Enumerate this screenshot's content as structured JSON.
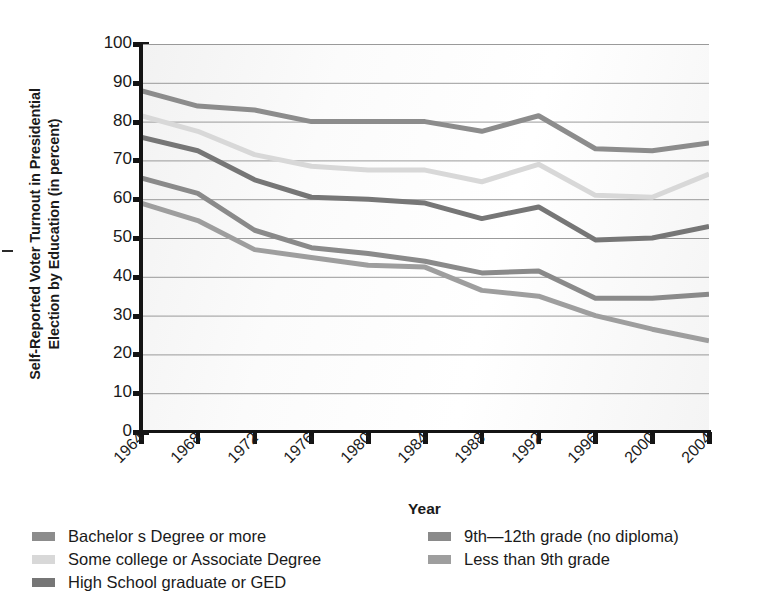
{
  "axis_titles": {
    "y_line1": "Self-Reported Voter Turnout in Presidential",
    "y_line2": "Election by Education (in percent)",
    "x": "Year"
  },
  "y_ticks": [
    "100",
    "90",
    "80",
    "70",
    "60",
    "50",
    "40",
    "30",
    "20",
    "10",
    "0"
  ],
  "x_ticks": [
    "1964",
    "1968",
    "1972",
    "1976",
    "1980",
    "1984",
    "1988",
    "1992",
    "1996",
    "2000",
    "2004"
  ],
  "legend": {
    "column_left": [
      {
        "label": "Bachelor s Degree or more",
        "color": "#8c8c8c"
      },
      {
        "label": "Some college or Associate Degree",
        "color": "#d8d8d8"
      },
      {
        "label": "High School graduate or GED",
        "color": "#767676"
      }
    ],
    "column_right": [
      {
        "label": "9th—12th grade (no diploma)",
        "color": "#8a8a8a"
      },
      {
        "label": "Less than 9th grade",
        "color": "#9e9e9e"
      }
    ]
  },
  "chart_data": {
    "type": "line",
    "title": "",
    "xlabel": "Year",
    "ylabel": "Self-Reported Voter Turnout in Presidential Election by Education (in percent)",
    "categories": [
      "1964",
      "1968",
      "1972",
      "1976",
      "1980",
      "1984",
      "1988",
      "1992",
      "1996",
      "2000",
      "2004"
    ],
    "x": [
      1964,
      1968,
      1972,
      1976,
      1980,
      1984,
      1988,
      1992,
      1996,
      2000,
      2004
    ],
    "ylim": [
      0,
      100
    ],
    "xlim": [
      1964,
      2004
    ],
    "ytick_step": 10,
    "grid": "horizontal",
    "legend_position": "below",
    "series": [
      {
        "name": "Bachelor s Degree or more",
        "color": "#8c8c8c",
        "values": [
          88.0,
          84.0,
          83.0,
          80.0,
          80.0,
          80.0,
          77.5,
          81.5,
          73.0,
          72.5,
          74.5
        ]
      },
      {
        "name": "Some college or Associate Degree",
        "color": "#d8d8d8",
        "values": [
          81.5,
          77.5,
          71.5,
          68.5,
          67.5,
          67.5,
          64.5,
          69.0,
          61.0,
          60.5,
          66.5
        ]
      },
      {
        "name": "High School graduate or GED",
        "color": "#767676",
        "values": [
          76.0,
          72.5,
          65.0,
          60.5,
          60.0,
          59.0,
          55.0,
          58.0,
          49.5,
          50.0,
          53.0
        ]
      },
      {
        "name": "9th—12th grade (no diploma)",
        "color": "#8a8a8a",
        "values": [
          65.5,
          61.5,
          52.0,
          47.5,
          46.0,
          44.0,
          41.0,
          41.5,
          34.5,
          34.5,
          35.5
        ]
      },
      {
        "name": "Less than 9th grade",
        "color": "#9e9e9e",
        "values": [
          59.0,
          54.5,
          47.0,
          45.0,
          43.0,
          42.5,
          36.5,
          35.0,
          30.0,
          26.5,
          23.5
        ]
      }
    ]
  }
}
